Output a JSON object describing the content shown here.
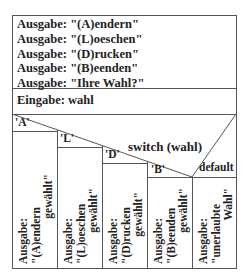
{
  "diagram": {
    "type": "Nassi-Shneiderman structogram",
    "output_block": [
      "Ausgabe: \"(A)endern\"",
      "Ausgabe: \"(L)oeschen\"",
      "Ausgabe: \"(D)rucken\"",
      "Ausgabe: \"(B)eenden\"",
      "Ausgabe: \"Ihre Wahl?\""
    ],
    "input_block": "Eingabe: wahl",
    "switch": {
      "label": "switch (wahl)",
      "cases": [
        {
          "label": "'A'",
          "line1": "Ausgabe:",
          "line2": "\"(A)endern",
          "line3": "gewählt\""
        },
        {
          "label": "'L'",
          "line1": "Ausgabe:",
          "line2": "\"(L)oeschen",
          "line3": "gewählt\""
        },
        {
          "label": "'D'",
          "line1": "Ausgabe:",
          "line2": "\"(D)rucken",
          "line3": "gewählt\""
        },
        {
          "label": "'B'",
          "line1": "Ausgabe:",
          "line2": "\"(B)eenden",
          "line3": "gewählt\""
        },
        {
          "label": "default",
          "line1": "Ausgabe:",
          "line2": "\"unerlaubte",
          "line3": "Wahl\""
        }
      ]
    },
    "colors": {
      "line": "#555555",
      "text": "#222222",
      "background": "#ffffff"
    }
  }
}
